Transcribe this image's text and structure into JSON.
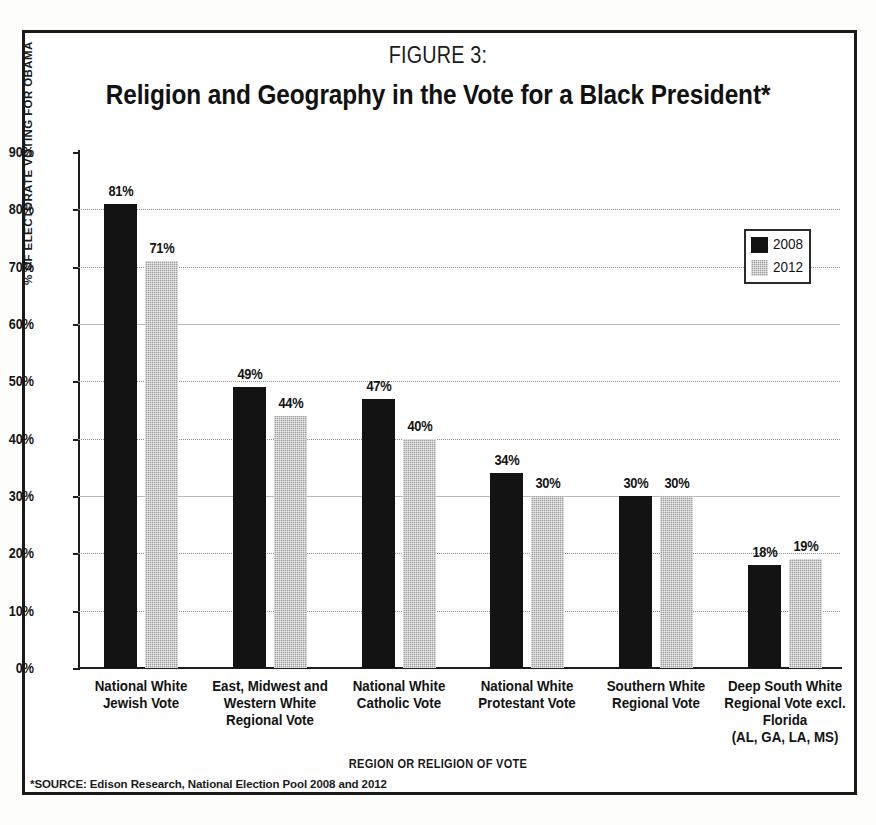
{
  "figure": {
    "number_label": "FIGURE 3:",
    "title": "Religion and Geography in the Vote for a Black President*",
    "source_note": "*SOURCE: Edison Research, National Election Pool 2008 and 2012"
  },
  "legend": {
    "entries": [
      {
        "label": "2008",
        "color": "#131313"
      },
      {
        "label": "2012",
        "color": "#9d9d9d"
      }
    ]
  },
  "axis": {
    "y_title": "% OF ELECTORATE VOTING FOR OBAMA",
    "x_title": "REGION OR RELIGION OF VOTE",
    "y_ticks": [
      "0%",
      "10%",
      "20%",
      "30%",
      "40%",
      "50%",
      "60%",
      "70%",
      "80%",
      "90%"
    ]
  },
  "chart_data": {
    "type": "bar",
    "title": "Religion and Geography in the Vote for a Black President*",
    "subtitle": "FIGURE 3:",
    "xlabel": "REGION OR RELIGION OF VOTE",
    "ylabel": "% OF ELECTORATE VOTING FOR OBAMA",
    "ylim": [
      0,
      90
    ],
    "ytick_step": 10,
    "grid": true,
    "legend_position": "upper-right",
    "categories": [
      "National White Jewish Vote",
      "East, Midwest and Western White Regional Vote",
      "National White Catholic Vote",
      "National White Protestant Vote",
      "Southern White Regional Vote",
      "Deep South White Regional Vote excl. Florida (AL, GA, LA, MS)"
    ],
    "category_lines": [
      [
        "National White",
        "Jewish Vote"
      ],
      [
        "East, Midwest and",
        "Western White",
        "Regional Vote"
      ],
      [
        "National White",
        "Catholic Vote"
      ],
      [
        "National White",
        "Protestant Vote"
      ],
      [
        "Southern White",
        "Regional Vote"
      ],
      [
        "Deep South White",
        "Regional Vote excl.",
        "Florida",
        "(AL, GA, LA, MS)"
      ]
    ],
    "series": [
      {
        "name": "2008",
        "color": "#131313",
        "values": [
          81,
          49,
          47,
          34,
          30,
          18
        ],
        "labels": [
          "81%",
          "49%",
          "47%",
          "34%",
          "30%",
          "18%"
        ]
      },
      {
        "name": "2012",
        "color": "#9d9d9d",
        "values": [
          71,
          44,
          40,
          30,
          30,
          19
        ],
        "labels": [
          "71%",
          "44%",
          "40%",
          "30%",
          "30%",
          "19%"
        ]
      }
    ],
    "source": "*SOURCE: Edison Research, National Election Pool 2008 and 2012"
  }
}
